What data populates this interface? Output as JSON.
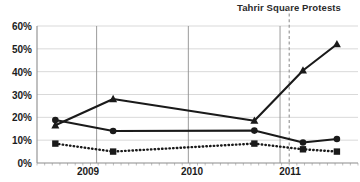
{
  "chart_data": {
    "type": "line",
    "title": "",
    "xlabel": "",
    "ylabel": "",
    "ylim": [
      0,
      60
    ],
    "ytick_labels": [
      "0%",
      "10%",
      "20%",
      "30%",
      "40%",
      "50%",
      "60%"
    ],
    "ytick_values": [
      0,
      10,
      20,
      30,
      40,
      50,
      60
    ],
    "xtick_labels": [
      "2009",
      "2010",
      "2011"
    ],
    "xtick_values": [
      2009,
      2010,
      2011
    ],
    "xlim": [
      2008.35,
      2011.85
    ],
    "grid": true,
    "legend_position": "none",
    "annotations": [
      {
        "text": "Tahrir Square Protests",
        "x": 2011.1,
        "type": "vertical-dashed-line-label"
      }
    ],
    "series": [
      {
        "name": "triangle-series",
        "marker": "triangle",
        "linestyle": "solid",
        "color": "#1a1a1a",
        "x": [
          2008.55,
          2009.18,
          2010.72,
          2011.25,
          2011.62
        ],
        "values": [
          16.5,
          28.0,
          18.5,
          40.5,
          52.0
        ]
      },
      {
        "name": "circle-series",
        "marker": "circle",
        "linestyle": "solid",
        "color": "#1a1a1a",
        "x": [
          2008.55,
          2009.18,
          2010.72,
          2011.25,
          2011.62
        ],
        "values": [
          18.8,
          14.0,
          14.2,
          9.0,
          10.5
        ]
      },
      {
        "name": "square-series",
        "marker": "square",
        "linestyle": "dotted",
        "color": "#1a1a1a",
        "x": [
          2008.55,
          2009.18,
          2010.72,
          2011.25,
          2011.62
        ],
        "values": [
          8.5,
          5.0,
          8.5,
          6.0,
          5.0
        ]
      }
    ]
  },
  "axis": {
    "ytick_0": "0%",
    "ytick_1": "10%",
    "ytick_2": "20%",
    "ytick_3": "30%",
    "ytick_4": "40%",
    "ytick_5": "50%",
    "ytick_6": "60%",
    "xtick_0": "2009",
    "xtick_1": "2010",
    "xtick_2": "2011"
  },
  "annotation": {
    "label": "Tahrir Square Protests"
  },
  "colors": {
    "line": "#1a1a1a",
    "grid": "#c8c8c8",
    "axis": "#8c8c8c",
    "text": "#1c1c1c",
    "event_line": "#9a9a9a"
  }
}
